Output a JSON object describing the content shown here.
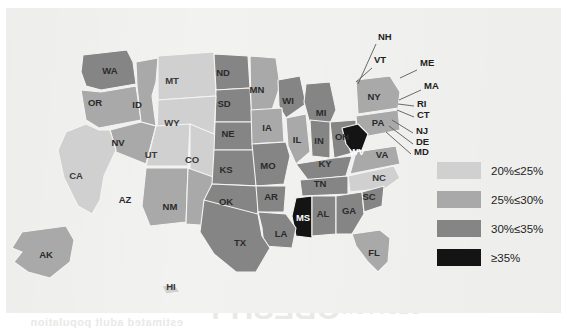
{
  "figure": {
    "type": "choropleth-map",
    "region": "United States",
    "legend_title": ""
  },
  "legend": {
    "items": [
      {
        "label": "20%≤25%",
        "color": "#d0d0d0",
        "range": [
          20,
          25
        ]
      },
      {
        "label": "25%≤30%",
        "color": "#a9a9a9",
        "range": [
          25,
          30
        ]
      },
      {
        "label": "30%≤35%",
        "color": "#858585",
        "range": [
          30,
          35
        ]
      },
      {
        "label": "≥35%",
        "color": "#141414",
        "range": [
          35,
          null
        ]
      }
    ]
  },
  "chart_data": {
    "type": "heatmap",
    "title": "",
    "xlabel": "",
    "ylabel": "",
    "categories": [
      "AL",
      "AK",
      "AZ",
      "AR",
      "CA",
      "CO",
      "CT",
      "DE",
      "FL",
      "GA",
      "HI",
      "ID",
      "IL",
      "IN",
      "IA",
      "KS",
      "KY",
      "LA",
      "ME",
      "MD",
      "MA",
      "MI",
      "MN",
      "MS",
      "MO",
      "MT",
      "NE",
      "NV",
      "NH",
      "NJ",
      "NM",
      "NY",
      "NC",
      "ND",
      "OH",
      "OK",
      "OR",
      "PA",
      "RI",
      "SC",
      "SD",
      "TN",
      "TX",
      "UT",
      "VT",
      "VA",
      "WA",
      "WV",
      "WI",
      "WY"
    ],
    "values": [
      "30-35",
      "25-30",
      "25-30",
      "30-35",
      "20-25",
      "20-25",
      "25-30",
      "30-35",
      "25-30",
      "30-35",
      "20-25",
      "25-30",
      "25-30",
      "30-35",
      "25-30",
      "30-35",
      "30-35",
      "30-35",
      "25-30",
      "30-35",
      "25-30",
      "30-35",
      "25-30",
      "35+",
      "30-35",
      "20-25",
      "30-35",
      "25-30",
      "25-30",
      "25-30",
      "25-30",
      "25-30",
      "20-25",
      "30-35",
      "30-35",
      "30-35",
      "25-30",
      "25-30",
      "25-30",
      "30-35",
      "30-35",
      "30-35",
      "30-35",
      "20-25",
      "25-30",
      "25-30",
      "25-30",
      "35+",
      "30-35",
      "20-25"
    ],
    "legend_position": "right"
  },
  "states": [
    {
      "code": "WA",
      "label": "WA",
      "band": "30-35",
      "color": "#858585",
      "lx": 110,
      "ly": 71
    },
    {
      "code": "OR",
      "label": "OR",
      "band": "25-30",
      "color": "#a9a9a9",
      "lx": 95,
      "ly": 103
    },
    {
      "code": "ID",
      "label": "ID",
      "band": "25-30",
      "color": "#a9a9a9",
      "lx": 137,
      "ly": 105
    },
    {
      "code": "MT",
      "label": "MT",
      "band": "20-25",
      "color": "#d0d0d0",
      "lx": 172,
      "ly": 81
    },
    {
      "code": "ND",
      "label": "ND",
      "band": "30-35",
      "color": "#858585",
      "lx": 223,
      "ly": 73
    },
    {
      "code": "MN",
      "label": "MN",
      "band": "25-30",
      "color": "#a9a9a9",
      "lx": 257,
      "ly": 90
    },
    {
      "code": "WI",
      "label": "WI",
      "band": "30-35",
      "color": "#858585",
      "lx": 288,
      "ly": 101
    },
    {
      "code": "SD",
      "label": "SD",
      "band": "30-35",
      "color": "#858585",
      "lx": 224,
      "ly": 104
    },
    {
      "code": "WY",
      "label": "WY",
      "band": "20-25",
      "color": "#d0d0d0",
      "lx": 172,
      "ly": 123
    },
    {
      "code": "NV",
      "label": "NV",
      "band": "25-30",
      "color": "#a9a9a9",
      "lx": 118,
      "ly": 143
    },
    {
      "code": "UT",
      "label": "UT",
      "band": "20-25",
      "color": "#d0d0d0",
      "lx": 151,
      "ly": 155
    },
    {
      "code": "CO",
      "label": "CO",
      "band": "20-25",
      "color": "#d0d0d0",
      "lx": 192,
      "ly": 160
    },
    {
      "code": "NE",
      "label": "NE",
      "band": "30-35",
      "color": "#858585",
      "lx": 228,
      "ly": 134
    },
    {
      "code": "IA",
      "label": "IA",
      "band": "25-30",
      "color": "#a9a9a9",
      "lx": 267,
      "ly": 128
    },
    {
      "code": "IL",
      "label": "IL",
      "band": "25-30",
      "color": "#a9a9a9",
      "lx": 297,
      "ly": 140
    },
    {
      "code": "MI",
      "label": "MI",
      "band": "30-35",
      "color": "#858585",
      "lx": 321,
      "ly": 113
    },
    {
      "code": "OH",
      "label": "OH",
      "band": "30-35",
      "color": "#858585",
      "lx": 342,
      "ly": 137
    },
    {
      "code": "PA",
      "label": "PA",
      "band": "25-30",
      "color": "#a9a9a9",
      "lx": 378,
      "ly": 123
    },
    {
      "code": "NY",
      "label": "NY",
      "band": "25-30",
      "color": "#a9a9a9",
      "lx": 374,
      "ly": 97
    },
    {
      "code": "IN",
      "label": "IN",
      "band": "30-35",
      "color": "#858585",
      "lx": 319,
      "ly": 141
    },
    {
      "code": "CA",
      "label": "CA",
      "band": "20-25",
      "color": "#d0d0d0",
      "lx": 76,
      "ly": 176
    },
    {
      "code": "AZ",
      "label": "AZ",
      "band": "25-30",
      "color": "#a9a9a9",
      "lx": 125,
      "ly": 200
    },
    {
      "code": "NM",
      "label": "NM",
      "band": "25-30",
      "color": "#a9a9a9",
      "lx": 170,
      "ly": 207
    },
    {
      "code": "KS",
      "label": "KS",
      "band": "30-35",
      "color": "#858585",
      "lx": 226,
      "ly": 170
    },
    {
      "code": "MO",
      "label": "MO",
      "band": "30-35",
      "color": "#858585",
      "lx": 268,
      "ly": 166
    },
    {
      "code": "KY",
      "label": "KY",
      "band": "30-35",
      "color": "#858585",
      "lx": 325,
      "ly": 164
    },
    {
      "code": "WV",
      "label": "WV",
      "band": "35+",
      "color": "#141414",
      "lx": 357,
      "ly": 152
    },
    {
      "code": "VA",
      "label": "VA",
      "band": "25-30",
      "color": "#a9a9a9",
      "lx": 382,
      "ly": 155
    },
    {
      "code": "NC",
      "label": "NC",
      "band": "20-25",
      "color": "#d0d0d0",
      "lx": 379,
      "ly": 178
    },
    {
      "code": "TN",
      "label": "TN",
      "band": "30-35",
      "color": "#858585",
      "lx": 320,
      "ly": 184
    },
    {
      "code": "OK",
      "label": "OK",
      "band": "30-35",
      "color": "#858585",
      "lx": 226,
      "ly": 202
    },
    {
      "code": "AR",
      "label": "AR",
      "band": "30-35",
      "color": "#858585",
      "lx": 271,
      "ly": 197
    },
    {
      "code": "MS",
      "label": "MS",
      "band": "35+",
      "color": "#141414",
      "lx": 303,
      "ly": 218
    },
    {
      "code": "AL",
      "label": "AL",
      "band": "30-35",
      "color": "#858585",
      "lx": 323,
      "ly": 214
    },
    {
      "code": "GA",
      "label": "GA",
      "band": "30-35",
      "color": "#858585",
      "lx": 349,
      "ly": 211
    },
    {
      "code": "SC",
      "label": "SC",
      "band": "30-35",
      "color": "#858585",
      "lx": 369,
      "ly": 197
    },
    {
      "code": "LA",
      "label": "LA",
      "band": "30-35",
      "color": "#858585",
      "lx": 281,
      "ly": 234
    },
    {
      "code": "TX",
      "label": "TX",
      "band": "30-35",
      "color": "#858585",
      "lx": 240,
      "ly": 243
    },
    {
      "code": "FL",
      "label": "FL",
      "band": "25-30",
      "color": "#a9a9a9",
      "lx": 374,
      "ly": 253
    },
    {
      "code": "AK",
      "label": "AK",
      "band": "25-30",
      "color": "#a9a9a9",
      "lx": 46,
      "ly": 255
    },
    {
      "code": "HI",
      "label": "HI",
      "band": "20-25",
      "color": "#d0d0d0",
      "lx": 171,
      "ly": 287
    }
  ],
  "callouts": [
    {
      "code": "NH",
      "label": "NH",
      "tx": 378,
      "ty": 37
    },
    {
      "code": "VT",
      "label": "VT",
      "tx": 374,
      "ty": 60
    },
    {
      "code": "ME",
      "label": "ME",
      "tx": 420,
      "ty": 63
    },
    {
      "code": "MA",
      "label": "MA",
      "tx": 424,
      "ty": 86
    },
    {
      "code": "RI",
      "label": "RI",
      "tx": 417,
      "ty": 104
    },
    {
      "code": "CT",
      "label": "CT",
      "tx": 417,
      "ty": 115
    },
    {
      "code": "NJ",
      "label": "NJ",
      "tx": 416,
      "ty": 131
    },
    {
      "code": "DE",
      "label": "DE",
      "tx": 416,
      "ty": 142
    },
    {
      "code": "MD",
      "label": "MD",
      "tx": 414,
      "ty": 152
    }
  ],
  "bleedthrough": [
    {
      "text": "anaerobic bacteria in the gut",
      "x": 30,
      "y": 24,
      "size": 11
    },
    {
      "text": "of microbial communities",
      "x": 210,
      "y": 24,
      "size": 11
    },
    {
      "text": "which may alter metabolism",
      "x": 380,
      "y": 24,
      "size": 11
    },
    {
      "text": "the prevalence of obesity",
      "x": 24,
      "y": 44,
      "size": 12
    },
    {
      "text": "surveillance systems report",
      "x": 250,
      "y": 44,
      "size": 12
    },
    {
      "text": "body mass index values",
      "x": 30,
      "y": 64,
      "size": 12
    },
    {
      "text": "national health and nutrition",
      "x": 300,
      "y": 64,
      "size": 12
    },
    {
      "text": "OBESITY",
      "x": 205,
      "y": 292,
      "size": 30
    },
    {
      "text": "GLUTTONY",
      "x": 330,
      "y": 300,
      "size": 16
    },
    {
      "text": "estimated adult population",
      "x": 30,
      "y": 316,
      "size": 11
    }
  ]
}
